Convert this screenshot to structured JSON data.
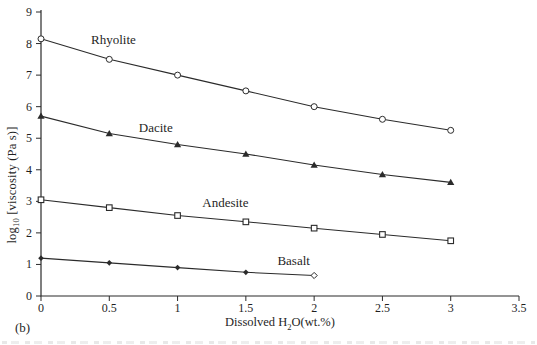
{
  "panel_label": "(b)",
  "colors": {
    "line": "#2b2b2b",
    "text": "#1f1f1f",
    "background": "#ffffff"
  },
  "chart_data": {
    "type": "line",
    "title": "",
    "xlabel": "Dissolved H2O(wt.%)",
    "ylabel": "log10 [viscosity (Pa s)]",
    "xlabel_parts": {
      "pre": "Dissolved H",
      "sub": "2",
      "post": "O(wt.%)"
    },
    "ylabel_parts": {
      "pre": "log",
      "sub": "10",
      "post": " [viscosity (Pa s)]"
    },
    "xlim": [
      0,
      3.5
    ],
    "ylim": [
      0,
      9
    ],
    "grid": false,
    "legend": "inline-labels",
    "x_ticks": [
      0,
      0.5,
      1,
      1.5,
      2,
      2.5,
      3,
      3.5
    ],
    "x_tick_labels": [
      "0",
      "0.5",
      "1",
      "1.5",
      "2",
      "2.5",
      "3",
      "3.5"
    ],
    "y_ticks": [
      0,
      1,
      2,
      3,
      4,
      5,
      6,
      7,
      8,
      9
    ],
    "y_tick_labels": [
      "0",
      "1",
      "2",
      "3",
      "4",
      "5",
      "6",
      "7",
      "8",
      "9"
    ],
    "series": [
      {
        "name": "Rhyolite",
        "marker": "circle-open",
        "x": [
          0,
          0.5,
          1,
          1.5,
          2,
          2.5,
          3
        ],
        "y": [
          8.15,
          7.5,
          7.0,
          6.5,
          6.0,
          5.6,
          5.25
        ],
        "label_pos": {
          "x": 0.53,
          "y": 8.11
        }
      },
      {
        "name": "Dacite",
        "marker": "triangle-filled",
        "x": [
          0,
          0.5,
          1,
          1.5,
          2,
          2.5,
          3
        ],
        "y": [
          5.7,
          5.15,
          4.8,
          4.5,
          4.15,
          3.85,
          3.6
        ],
        "label_pos": {
          "x": 0.84,
          "y": 5.32
        }
      },
      {
        "name": "Andesite",
        "marker": "square-open",
        "x": [
          0,
          0.5,
          1,
          1.5,
          2,
          2.5,
          3
        ],
        "y": [
          3.05,
          2.8,
          2.55,
          2.35,
          2.15,
          1.95,
          1.75
        ],
        "label_pos": {
          "x": 1.35,
          "y": 2.95
        }
      },
      {
        "name": "Basalt",
        "marker": "diamond-filled",
        "end_marker": "diamond-open",
        "x": [
          0,
          0.5,
          1,
          1.5,
          2
        ],
        "y": [
          1.2,
          1.05,
          0.9,
          0.75,
          0.65
        ],
        "label_pos": {
          "x": 1.85,
          "y": 1.12
        }
      }
    ]
  }
}
